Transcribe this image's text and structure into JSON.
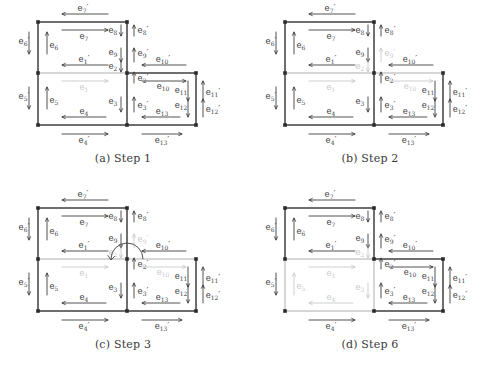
{
  "figure": {
    "type": "diagram",
    "colors": {
      "active": "#3f3f3f",
      "inactive": "#c9c9c9",
      "vertex": "#2b2b2b",
      "background": "#ffffff"
    }
  },
  "panels": [
    {
      "id": "a",
      "caption": "(a) Step 1",
      "inactive_labels": [
        "e1"
      ],
      "inactive_edges": [
        "mid-left-horizontal"
      ],
      "arc": false
    },
    {
      "id": "b",
      "caption": "(b) Step 2",
      "inactive_labels": [
        "e1",
        "e2",
        "e9p",
        "e10"
      ],
      "inactive_edges": [
        "mid-left-horizontal",
        "mid-right-horizontal"
      ],
      "arc": false
    },
    {
      "id": "c",
      "caption": "(c) Step 3",
      "inactive_labels": [
        "e1",
        "e2",
        "e9p",
        "e10"
      ],
      "inactive_edges": [
        "mid-left-horizontal",
        "mid-right-horizontal"
      ],
      "arc": true
    },
    {
      "id": "d",
      "caption": "(d) Step 6",
      "inactive_labels": [
        "e1",
        "e2",
        "e3",
        "e4",
        "e5"
      ],
      "inactive_edges": [
        "mid-left-horizontal",
        "left-lower-vertical",
        "bottom-left-horizontal",
        "center-lower-vertical"
      ],
      "arc": false
    }
  ],
  "labels": {
    "e1": "e₁",
    "e1p": "e₁′",
    "e2": "e₂",
    "e2p": "e₂′",
    "e3": "e₃",
    "e3p": "e₃′",
    "e4": "e₄",
    "e4p": "e₄′",
    "e5": "e₅",
    "e5p": "e₅′",
    "e6": "e₆",
    "e6p": "e₆′",
    "e7": "e₇",
    "e7p": "e₇′",
    "e8": "e₈",
    "e8p": "e₈′",
    "e9": "e₉",
    "e9p": "e₉′",
    "e10": "e₁₀",
    "e10p": "e₁₀′",
    "e11": "e₁₁",
    "e11p": "e₁₁′",
    "e12": "e₁₂",
    "e12p": "e₁₂′",
    "e13": "e₁₃",
    "e13p": "e₁₃′"
  },
  "captions": {
    "a": "(a) Step 1",
    "b": "(b) Step 2",
    "c": "(c) Step 3",
    "d": "(d) Step 6"
  }
}
